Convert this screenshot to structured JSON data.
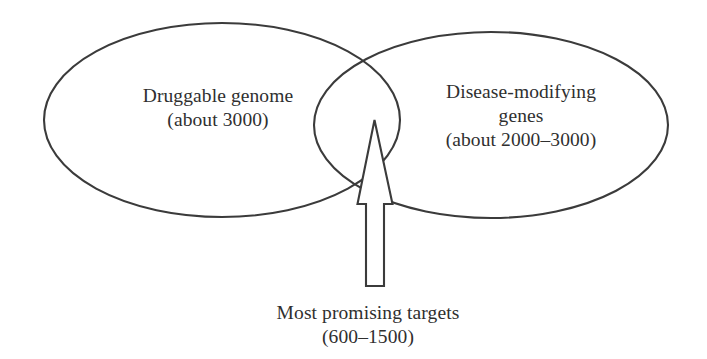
{
  "figure": {
    "type": "venn-diagram",
    "background_color": "#ffffff",
    "stroke_color": "#3b3b3b",
    "text_color": "#2f2f2f"
  },
  "sets": {
    "left": {
      "name": "Druggable genome",
      "count_label": "(about 3000)",
      "count_min": 3000,
      "count_max": 3000
    },
    "right": {
      "name_line1": "Disease-modifying",
      "name_line2": "genes",
      "count_label": "(about 2000–3000)",
      "count_min": 2000,
      "count_max": 3000
    },
    "intersection": {
      "name": "Most promising targets",
      "count_label": "(600–1500)",
      "count_min": 600,
      "count_max": 1500
    }
  },
  "annotations": {
    "arrow": {
      "icon": "up-arrow-outline",
      "direction": "up",
      "points_to": "intersection"
    }
  }
}
